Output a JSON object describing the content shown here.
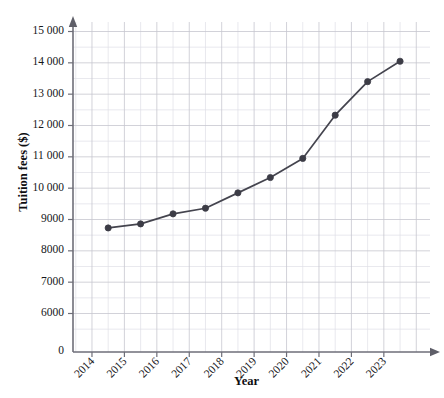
{
  "figure": {
    "crop_artifact_text": "",
    "background": "#ffffff"
  },
  "chart_data": {
    "type": "line",
    "title": "",
    "xlabel": "Year",
    "ylabel": "Tuition fees ($)",
    "x": [
      2014.5,
      2015.5,
      2016.5,
      2017.5,
      2018.5,
      2019.5,
      2020.5,
      2021.5,
      2022.5,
      2023.5
    ],
    "values": [
      8730,
      8860,
      9180,
      9360,
      9850,
      10340,
      10950,
      12330,
      13400,
      14050
    ],
    "series": [
      {
        "name": "Tuition fees",
        "values": [
          8730,
          8860,
          9180,
          9360,
          9850,
          10340,
          10950,
          12330,
          13400,
          14050
        ]
      }
    ],
    "x_tick_labels": [
      "2014",
      "2015",
      "2016",
      "2017",
      "2018",
      "2019",
      "2020",
      "2021",
      "2022",
      "2023"
    ],
    "x_tick_values": [
      2014,
      2015,
      2016,
      2017,
      2018,
      2019,
      2020,
      2021,
      2022,
      2023
    ],
    "y_tick_labels": [
      "6000",
      "7000",
      "8000",
      "9000",
      "10 000",
      "11 000",
      "12 000",
      "13 000",
      "14 000",
      "15 000"
    ],
    "y_tick_values": [
      6000,
      7000,
      8000,
      9000,
      10000,
      11000,
      12000,
      13000,
      14000,
      15000
    ],
    "origin_label": "0",
    "xlim": [
      2013.6,
      2024.3
    ],
    "ylim": [
      5550,
      15450
    ],
    "grid": true,
    "grid_minor": true,
    "legend": "none",
    "marker": "circle",
    "line_color": "#44444e",
    "marker_color": "#3c3c46",
    "grid_major_color": "#c6c7cf",
    "grid_minor_color": "#dfe0e6",
    "axis_color": "#6e6e78"
  }
}
